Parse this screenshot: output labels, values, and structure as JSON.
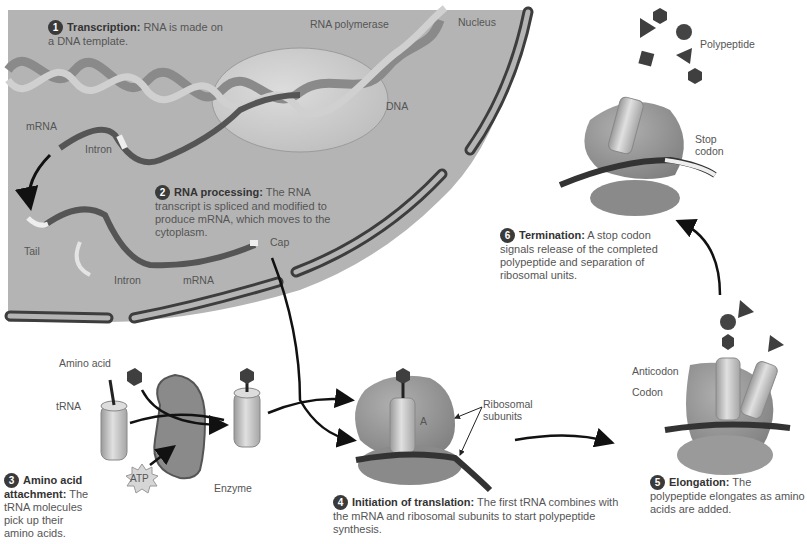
{
  "figure": {
    "colors": {
      "nucleus_fill": "#b4b4b4",
      "envelope": "#3d3d3d",
      "ribosome": "#8f8f8f",
      "trna": "#cfcfcf",
      "mrna": "#505050",
      "background": "#ffffff"
    },
    "region_labels": {
      "nucleus": "Nucleus"
    },
    "labels": {
      "rna_polymerase": "RNA polymerase",
      "dna": "DNA",
      "mrna_top": "mRNA",
      "intron_top": "Intron",
      "tail": "Tail",
      "intron_bottom": "Intron",
      "mrna_bottom": "mRNA",
      "cap": "Cap",
      "amino_acid": "Amino acid",
      "trna": "tRNA",
      "enzyme": "Enzyme",
      "atp": "ATP",
      "ribosomal_subunits": "Ribosomal subunits",
      "a_site": "A",
      "anticodon": "Anticodon",
      "codon": "Codon",
      "stop_codon": "Stop codon",
      "polypeptide": "Polypeptide"
    },
    "steps": [
      {
        "number": "1",
        "title": "Transcription:",
        "text": "RNA is made on a DNA template."
      },
      {
        "number": "2",
        "title": "RNA processing:",
        "text": "The RNA transcript is spliced and modified to produce mRNA, which moves to the cytoplasm."
      },
      {
        "number": "3",
        "title": "Amino acid attachment:",
        "text": "The tRNA molecules pick up their amino acids."
      },
      {
        "number": "4",
        "title": "Initiation of translation:",
        "text": "The first tRNA combines with the mRNA and ribosomal subunits to start polypeptide synthesis."
      },
      {
        "number": "5",
        "title": "Elongation:",
        "text": "The polypeptide elongates as amino acids are added."
      },
      {
        "number": "6",
        "title": "Termination:",
        "text": "A stop codon signals release of the completed polypeptide and separation of ribosomal units."
      }
    ]
  }
}
